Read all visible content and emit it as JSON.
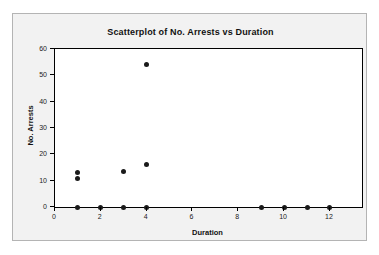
{
  "chart_data": {
    "type": "scatter",
    "title": "Scatterplot of No. Arrests vs Duration",
    "xlabel": "Duration",
    "ylabel": "No. Arrests",
    "xlim": [
      0,
      13.4
    ],
    "ylim": [
      0,
      60
    ],
    "xticks": [
      0,
      2,
      4,
      6,
      8,
      10,
      12
    ],
    "xtick_labels": [
      "0",
      "2",
      "4",
      "6",
      "8",
      "10",
      "12"
    ],
    "yticks": [
      0,
      10,
      20,
      30,
      40,
      50,
      60
    ],
    "ytick_labels": [
      "0",
      "10",
      "20",
      "30",
      "40",
      "50",
      "60"
    ],
    "grid": false,
    "legend": false,
    "marker": "filled-circle",
    "marker_color": "#1a1a1a",
    "points": [
      {
        "x": 1,
        "y": 13
      },
      {
        "x": 1,
        "y": 11
      },
      {
        "x": 3,
        "y": 13.5
      },
      {
        "x": 4,
        "y": 16
      },
      {
        "x": 4,
        "y": 54
      },
      {
        "x": 1,
        "y": 0
      },
      {
        "x": 2,
        "y": 0
      },
      {
        "x": 3,
        "y": 0
      },
      {
        "x": 4,
        "y": 0
      },
      {
        "x": 9,
        "y": 0
      },
      {
        "x": 10,
        "y": 0
      },
      {
        "x": 11,
        "y": 0
      },
      {
        "x": 12,
        "y": 0
      }
    ]
  },
  "colors": {
    "frame_border": "#b4b4b4",
    "frame_background": "#f2f2f2",
    "plot_background": "#ffffff",
    "axis": "#000000",
    "text": "#111111",
    "marker": "#1a1a1a"
  }
}
